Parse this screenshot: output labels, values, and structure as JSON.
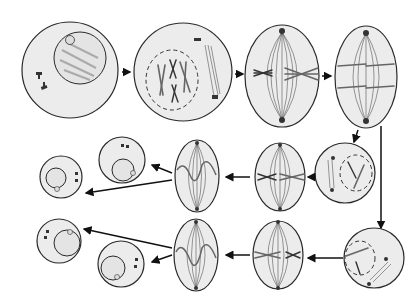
{
  "diagram": {
    "type": "cell-division-meiosis",
    "colors": {
      "cell_fill": "#ececec",
      "outline": "#2a2a2a",
      "chromosome": "#cfcfcf",
      "arrow": "#111111"
    },
    "rows": [
      {
        "name": "meiosis-I",
        "stages": [
          "interphase",
          "prophase-I",
          "metaphase-I",
          "anaphase-I"
        ]
      },
      {
        "name": "meiosis-II-upper",
        "stages": [
          "prophase-II",
          "metaphase-II",
          "anaphase-II",
          "daughter-cell",
          "daughter-cell"
        ]
      },
      {
        "name": "meiosis-II-lower",
        "stages": [
          "prophase-II",
          "metaphase-II",
          "anaphase-II",
          "daughter-cell",
          "daughter-cell"
        ]
      }
    ],
    "labels": {
      "interphase": "Interphase",
      "prophase1": "Prophase I",
      "metaphase1": "Metaphase I",
      "anaphase1": "Anaphase I",
      "prophase2a": "Prophase II",
      "metaphase2a": "Metaphase II",
      "anaphase2a": "Anaphase II",
      "prophase2b": "Prophase II",
      "metaphase2b": "Metaphase II",
      "anaphase2b": "Anaphase II",
      "daughter": "Daughter cell"
    }
  }
}
